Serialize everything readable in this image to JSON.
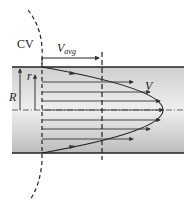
{
  "diagram": {
    "labels": {
      "cv": "CV",
      "vavg_main": "V",
      "vavg_sub": "avg",
      "velocity": "V",
      "radius_full": "R",
      "radius_local": "r"
    },
    "colors": {
      "wall": "#222222",
      "pipe_fill_top": "#e6e6e6",
      "pipe_fill_bottom": "#bdbdbd",
      "lines": "#333333"
    },
    "profile_rows_y": [
      82,
      92,
      101,
      110,
      120,
      129,
      139
    ]
  }
}
